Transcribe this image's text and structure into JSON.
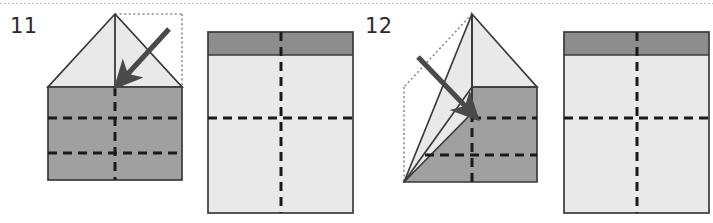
{
  "page": {
    "width": 713,
    "height": 223,
    "background": "#ffffff",
    "top_divider": {
      "name": "dotted-rule",
      "style": "dotted",
      "color": "#b9b9b9",
      "y": 3
    }
  },
  "colors": {
    "paper_light": "#e9e9e9",
    "paper_mid_gray": "#a0a0a0",
    "paper_dark_gray": "#8d8d8d",
    "outline": "#3a3a3a",
    "crease_dashed": "#1a1a1a",
    "ghost_dotted": "#8a8a8a",
    "arrow": "#4a4a4a",
    "label_text": "#2b2b2b"
  },
  "steps": [
    {
      "number": "11",
      "label_x": 10,
      "label_y": 16,
      "before": {
        "name": "figure-step-11-before",
        "caption": "",
        "body": {
          "x": 48,
          "y": 87,
          "w": 134,
          "h": 93,
          "fill": "#a0a0a0"
        },
        "triangle": {
          "apex_x": 115,
          "apex_y": 14,
          "left_x": 48,
          "left_y": 87,
          "right_x": 182,
          "right_y": 87,
          "fill": "#e9e9e9"
        },
        "ghost_square": {
          "x": 115,
          "y": 14,
          "w": 67,
          "h": 73
        },
        "center_solid_crease": {
          "x": 115,
          "y1": 14,
          "y2": 87
        },
        "dashed_vertical": {
          "x": 115,
          "y1": 87,
          "y2": 180
        },
        "dashed_horizontals": [
          {
            "y": 118,
            "x1": 48,
            "x2": 182
          },
          {
            "y": 153,
            "x1": 48,
            "x2": 182
          }
        ],
        "arrow": {
          "x1": 169,
          "y1": 29,
          "x2": 124,
          "y2": 78
        }
      },
      "after": {
        "name": "figure-step-11-after",
        "rect": {
          "x": 208,
          "y": 32,
          "w": 145,
          "h": 181
        },
        "top_band": {
          "height": 23,
          "fill": "#8d8d8d"
        },
        "body_fill": "#e9e9e9",
        "dashed_horizontal": {
          "y": 118
        },
        "dashed_vertical": {
          "x": 281
        }
      }
    },
    {
      "number": "12",
      "label_x": 365,
      "label_y": 16,
      "before": {
        "name": "figure-step-12-before",
        "caption": "",
        "apex_x": 472,
        "apex_y": 14,
        "right_x": 537,
        "right_y": 87,
        "body_right": {
          "x": 472,
          "y": 87,
          "w": 65,
          "h": 95,
          "fill": "#a0a0a0"
        },
        "bottom_left_gray": [
          [
            404,
            182
          ],
          [
            472,
            182
          ],
          [
            472,
            113
          ],
          [
            404,
            182
          ]
        ],
        "folded_flap": [
          [
            472,
            14
          ],
          [
            404,
            182
          ],
          [
            440,
            182
          ],
          [
            472,
            113
          ]
        ],
        "light_right_triangle": [
          [
            472,
            14
          ],
          [
            537,
            87
          ],
          [
            472,
            87
          ]
        ],
        "ghost_dotted_lines": [
          {
            "x1": 472,
            "y1": 14,
            "x2": 404,
            "y2": 87
          },
          {
            "x1": 404,
            "y1": 87,
            "x2": 404,
            "y2": 182
          }
        ],
        "center_solid_crease": {
          "x": 472,
          "y1": 14,
          "y2": 113
        },
        "dashed_vertical": {
          "x": 472,
          "y1": 113,
          "y2": 182
        },
        "dashed_horizontals": [
          {
            "y": 118,
            "x1": 472,
            "x2": 537
          },
          {
            "y": 155,
            "x1": 425,
            "x2": 537
          }
        ],
        "arrow": {
          "x1": 418,
          "y1": 57,
          "x2": 469,
          "y2": 110
        }
      },
      "after": {
        "name": "figure-step-12-after",
        "rect": {
          "x": 564,
          "y": 32,
          "w": 145,
          "h": 181
        },
        "top_band": {
          "height": 23,
          "fill": "#8d8d8d"
        },
        "body_fill": "#e9e9e9",
        "dashed_horizontal": {
          "y": 118
        },
        "dashed_vertical": {
          "x": 637
        }
      }
    }
  ]
}
